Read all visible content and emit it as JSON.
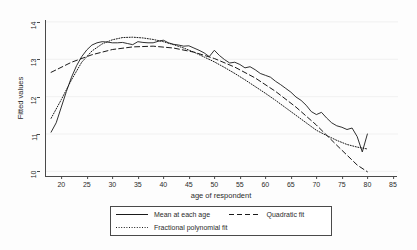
{
  "chart_data": {
    "type": "line",
    "title": "",
    "xlabel": "age of respondent",
    "ylabel": "Fitted values",
    "xlim": [
      17,
      86
    ],
    "ylim": [
      9.85,
      14.05
    ],
    "xticks": [
      20,
      25,
      30,
      35,
      40,
      45,
      50,
      55,
      60,
      65,
      70,
      75,
      80,
      85
    ],
    "yticks": [
      10,
      11,
      12,
      13,
      14
    ],
    "grid": "horizontal-faint",
    "legend_position": "below-plot",
    "series": [
      {
        "name": "Mean at each age",
        "style": "solid",
        "color": "#1a1a1a",
        "x": [
          18,
          19,
          20,
          21,
          22,
          23,
          24,
          25,
          26,
          27,
          28,
          29,
          30,
          31,
          32,
          33,
          34,
          35,
          36,
          37,
          38,
          39,
          40,
          41,
          42,
          43,
          44,
          45,
          46,
          47,
          48,
          49,
          50,
          51,
          52,
          53,
          54,
          55,
          56,
          57,
          58,
          59,
          60,
          61,
          62,
          63,
          64,
          65,
          66,
          67,
          68,
          69,
          70,
          71,
          72,
          73,
          74,
          75,
          76,
          77,
          78,
          79,
          80
        ],
        "y": [
          11.05,
          11.3,
          11.72,
          12.14,
          12.52,
          12.83,
          13.07,
          13.25,
          13.38,
          13.44,
          13.47,
          13.46,
          13.44,
          13.44,
          13.45,
          13.42,
          13.39,
          13.47,
          13.45,
          13.44,
          13.44,
          13.48,
          13.51,
          13.44,
          13.4,
          13.38,
          13.35,
          13.36,
          13.3,
          13.24,
          13.17,
          13.07,
          13.24,
          13.1,
          12.99,
          12.9,
          12.92,
          12.86,
          12.77,
          12.8,
          12.72,
          12.62,
          12.57,
          12.52,
          12.41,
          12.32,
          12.22,
          12.12,
          11.99,
          11.9,
          11.77,
          11.6,
          11.52,
          11.58,
          11.43,
          11.3,
          11.22,
          11.18,
          11.12,
          11.16,
          10.93,
          10.52,
          11.0
        ]
      },
      {
        "name": "Quadratic fit",
        "style": "dashed",
        "color": "#1a1a1a",
        "x": [
          18,
          22,
          26,
          30,
          34,
          38,
          42,
          46,
          50,
          54,
          58,
          62,
          66,
          70,
          74,
          78,
          80
        ],
        "y": [
          12.65,
          12.92,
          13.12,
          13.26,
          13.33,
          13.35,
          13.3,
          13.19,
          13.02,
          12.79,
          12.5,
          12.14,
          11.72,
          11.24,
          10.7,
          10.17,
          9.99
        ]
      },
      {
        "name": "Fractional polynomial fit",
        "style": "dotted",
        "color": "#1a1a1a",
        "x": [
          18,
          20,
          22,
          24,
          26,
          28,
          30,
          32,
          34,
          36,
          38,
          40,
          42,
          44,
          46,
          48,
          50,
          52,
          54,
          56,
          58,
          60,
          62,
          64,
          66,
          68,
          70,
          72,
          74,
          76,
          78,
          80
        ],
        "y": [
          11.42,
          11.92,
          12.45,
          12.92,
          13.22,
          13.41,
          13.52,
          13.58,
          13.59,
          13.57,
          13.53,
          13.47,
          13.39,
          13.3,
          13.19,
          13.06,
          12.93,
          12.78,
          12.62,
          12.45,
          12.27,
          12.09,
          11.9,
          11.7,
          11.5,
          11.3,
          11.1,
          10.96,
          10.83,
          10.72,
          10.65,
          10.6
        ]
      }
    ]
  },
  "legend": {
    "entries": [
      {
        "label": "Mean at each age",
        "style": "solid"
      },
      {
        "label": "Quadratic fit",
        "style": "dashed"
      },
      {
        "label": "Fractional polynomial fit",
        "style": "dotted"
      }
    ]
  }
}
